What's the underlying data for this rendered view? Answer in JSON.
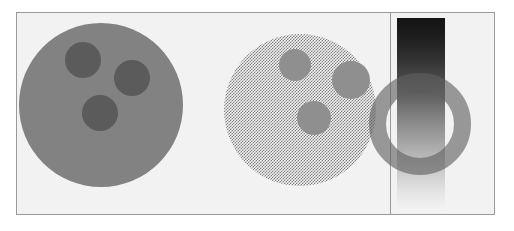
{
  "figure": {
    "width": 514,
    "height": 231,
    "background_color": "#ffffff",
    "plate": {
      "background_color": "#f2f2f2",
      "border_color": "#9a9a9a"
    }
  },
  "panels": [
    {
      "id": "panel-opaque",
      "name": "opaque-disc-panel",
      "description": "Solid opaque gray disc with three darker circular spots"
    },
    {
      "id": "panel-dithered",
      "name": "dithered-disc-panel",
      "description": "Same disc rendered with a 50% checkerboard dither producing a semi-transparent appearance"
    },
    {
      "id": "panel-gradient",
      "name": "gradient-ring-panel",
      "description": "Vertical black-to-white gradient bar overlaid by a semi-transparent gray annulus"
    }
  ],
  "shapes": {
    "opaque_disc": {
      "label": "opaque-disc",
      "fill_color": "#828282",
      "cx": 100,
      "cy": 108,
      "r": 82,
      "spots": [
        {
          "label": "spot-upper-left",
          "cx": 82,
          "cy": 63,
          "r": 18,
          "fill_color": "#5b5b5b"
        },
        {
          "label": "spot-upper-right",
          "cx": 131,
          "cy": 81,
          "r": 18,
          "fill_color": "#5b5b5b"
        },
        {
          "label": "spot-lower",
          "cx": 99,
          "cy": 116,
          "r": 18,
          "fill_color": "#5b5b5b"
        }
      ]
    },
    "dithered_disc": {
      "label": "dithered-disc",
      "fill_color": "#828282",
      "pattern": "checkerboard-50-percent",
      "cx": 314,
      "cy": 113,
      "r": 76,
      "spots": [
        {
          "label": "spot-upper-left",
          "cx": 295,
          "cy": 68,
          "r": 16,
          "fill_color": "#8f8f8f"
        },
        {
          "label": "spot-upper-right",
          "cx": 351,
          "cy": 83,
          "r": 19,
          "fill_color": "#8f8f8f"
        },
        {
          "label": "spot-lower",
          "cx": 313,
          "cy": 121,
          "r": 17,
          "fill_color": "#8f8f8f"
        }
      ]
    },
    "gradient_bar": {
      "label": "gradient-bar",
      "x": 413,
      "y": 18,
      "width": 48,
      "height": 192,
      "top_color": "#141414",
      "bottom_color": "#f4f4f4",
      "direction": "top-to-bottom"
    },
    "ring": {
      "label": "translucent-ring",
      "cx": 436,
      "cy": 124,
      "outer_r": 51,
      "thickness": 17,
      "stroke_color": "#606060",
      "opacity": 0.62
    },
    "panel_divider": {
      "label": "panel-divider",
      "x": 406,
      "color": "#9a9a9a"
    }
  }
}
